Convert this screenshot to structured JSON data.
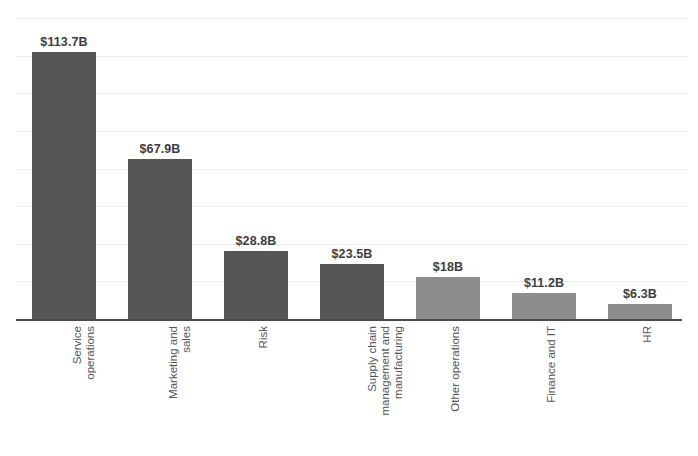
{
  "chart_data": {
    "type": "bar",
    "title": "",
    "subtitle": "",
    "xlabel": "",
    "ylabel": "",
    "ylim": [
      0,
      128
    ],
    "grid": true,
    "gridlines": [
      0,
      16,
      32,
      48,
      64,
      80,
      96,
      112,
      128
    ],
    "legend": "none",
    "orientation": "vertical",
    "label_rotation": -90,
    "categories": [
      "Service operations",
      "Marketing and sales",
      "Risk",
      "Supply chain management and manufacturing",
      "Other operations",
      "Finance and IT",
      "HR"
    ],
    "category_lines": [
      [
        "Service",
        "operations"
      ],
      [
        "Marketing and",
        "sales"
      ],
      [
        "Risk"
      ],
      [
        "Supply chain",
        "management and",
        "manufacturing"
      ],
      [
        "Other operations"
      ],
      [
        "Finance and IT"
      ],
      [
        "HR"
      ]
    ],
    "values": [
      113.7,
      67.9,
      28.8,
      23.5,
      18,
      11.2,
      6.3
    ],
    "value_labels": [
      "$113.7B",
      "$67.9B",
      "$28.8B",
      "$23.5B",
      "$18B",
      "$11.2B",
      "$6.3B"
    ],
    "units": "USD billions",
    "bar_colors": [
      "#565656",
      "#565656",
      "#565656",
      "#565656",
      "#8d8d8d",
      "#8d8d8d",
      "#8d8d8d"
    ],
    "colors": {
      "bar_dark": "#565656",
      "bar_light": "#8d8d8d",
      "gridline": "#ececec",
      "axis": "#4a4a4a",
      "value_text": "#3d3d3d",
      "category_text": "#57575a",
      "background": "#ffffff"
    }
  }
}
